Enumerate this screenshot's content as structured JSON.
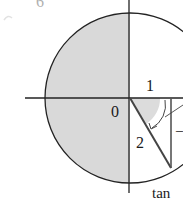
{
  "figure": {
    "corner_label": "6",
    "labels": {
      "one": "1",
      "origin": "0",
      "two": "2",
      "tan": "tan",
      "dash": "–"
    },
    "colors": {
      "stroke": "#222222",
      "shade": "#d9d9d9",
      "background": "#ffffff",
      "faint_label": "#b0b0b0"
    }
  }
}
